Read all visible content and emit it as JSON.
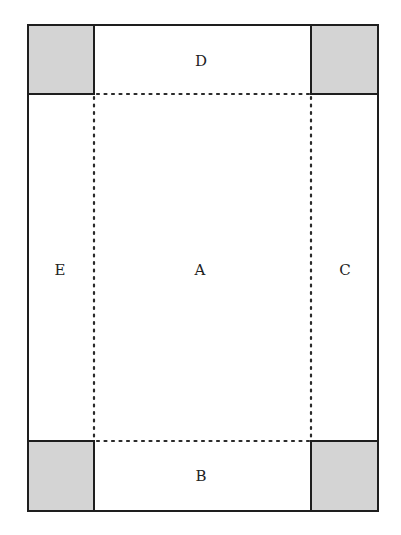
{
  "diagram": {
    "type": "net-of-open-box",
    "colors": {
      "stroke": "#1e1e1e",
      "corner_fill": "#d4d4d4",
      "background": "#ffffff",
      "fold_line": "#2a2a2a"
    },
    "outer_rect": {
      "x": 28,
      "y": 25,
      "width": 350,
      "height": 486
    },
    "inner_rect": {
      "x": 94,
      "y": 94,
      "width": 217,
      "height": 347
    },
    "corner_squares": [
      {
        "id": "top-left",
        "x": 28,
        "y": 25,
        "width": 66,
        "height": 69,
        "shaded": true
      },
      {
        "id": "top-right",
        "x": 311,
        "y": 25,
        "width": 67,
        "height": 69,
        "shaded": true
      },
      {
        "id": "bottom-left",
        "x": 28,
        "y": 441,
        "width": 66,
        "height": 70,
        "shaded": true
      },
      {
        "id": "bottom-right",
        "x": 311,
        "y": 441,
        "width": 67,
        "height": 70,
        "shaded": true
      }
    ],
    "regions": [
      {
        "id": "A",
        "label": "A",
        "role": "base",
        "label_x": 200,
        "label_y": 275
      },
      {
        "id": "B",
        "label": "B",
        "role": "bottom-flap",
        "label_x": 201,
        "label_y": 481
      },
      {
        "id": "C",
        "label": "C",
        "role": "right-flap",
        "label_x": 345,
        "label_y": 275
      },
      {
        "id": "D",
        "label": "D",
        "role": "top-flap",
        "label_x": 201,
        "label_y": 66
      },
      {
        "id": "E",
        "label": "E",
        "role": "left-flap",
        "label_x": 60,
        "label_y": 275
      }
    ],
    "fold_lines": "dotted"
  }
}
